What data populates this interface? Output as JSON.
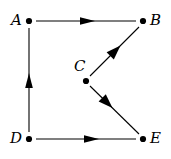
{
  "figure": {
    "type": "directed-graph-diagram",
    "width": 171,
    "height": 159,
    "background_color": "#ffffff",
    "stroke_color": "#000000",
    "node_color": "#000000"
  },
  "nodes": [
    {
      "id": "A",
      "label": "A",
      "x": 29,
      "y": 21,
      "label_x": 11,
      "label_y": 14,
      "label_position": "left"
    },
    {
      "id": "B",
      "label": "B",
      "x": 143,
      "y": 21,
      "label_x": 150,
      "label_y": 14,
      "label_position": "right"
    },
    {
      "id": "C",
      "label": "C",
      "x": 86,
      "y": 81,
      "label_x": 74,
      "label_y": 60,
      "label_position": "above-left"
    },
    {
      "id": "D",
      "label": "D",
      "x": 29,
      "y": 139,
      "label_x": 10,
      "label_y": 132,
      "label_position": "left"
    },
    {
      "id": "E",
      "label": "E",
      "x": 143,
      "y": 139,
      "label_x": 150,
      "label_y": 132,
      "label_position": "right"
    }
  ],
  "edges": [
    {
      "id": "A-B",
      "from": "A",
      "to": "B",
      "x1": 36,
      "y1": 21,
      "x2": 136,
      "y2": 21,
      "arrow_at": 0.52,
      "direction": "right"
    },
    {
      "id": "D-A",
      "from": "D",
      "to": "A",
      "x1": 29,
      "y1": 132,
      "x2": 29,
      "y2": 28,
      "arrow_at": 0.55,
      "direction": "up"
    },
    {
      "id": "C-B",
      "from": "C",
      "to": "B",
      "x1": 90,
      "y1": 76,
      "x2": 139,
      "y2": 27,
      "arrow_at": 0.58,
      "direction": "up-right"
    },
    {
      "id": "C-E",
      "from": "C",
      "to": "E",
      "x1": 90,
      "y1": 86,
      "x2": 139,
      "y2": 134,
      "arrow_at": 0.45,
      "direction": "down-right"
    },
    {
      "id": "D-E",
      "from": "D",
      "to": "E",
      "x1": 36,
      "y1": 139,
      "x2": 136,
      "y2": 139,
      "arrow_at": 0.62,
      "direction": "right"
    }
  ]
}
